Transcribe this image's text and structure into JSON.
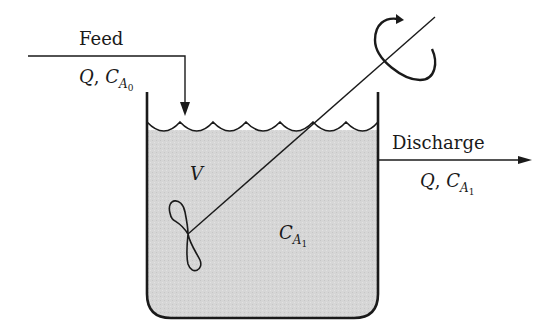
{
  "diagram": {
    "type": "continuous stirred tank reactor",
    "feed": {
      "label": "Feed",
      "flow_symbol": "Q",
      "conc_symbol": "C",
      "conc_sub": "A",
      "conc_subsub": "0"
    },
    "discharge": {
      "label": "Discharge",
      "flow_symbol": "Q",
      "conc_symbol": "C",
      "conc_sub": "A",
      "conc_subsub": "1"
    },
    "tank": {
      "volume_symbol": "V",
      "conc_symbol": "C",
      "conc_sub": "A",
      "conc_subsub": "1",
      "fill_color": "#d4d4d4"
    },
    "separator": ","
  }
}
